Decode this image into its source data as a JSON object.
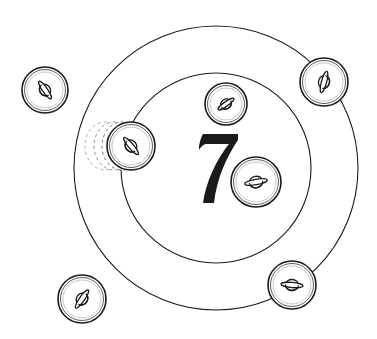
{
  "scene": {
    "title": "Coin toss ring game",
    "number": "7",
    "background": "#ffffff",
    "ink": "#1a1a1a",
    "outer_ring": {
      "cx": 216,
      "cy": 168,
      "r": 142
    },
    "inner_ring": {
      "cx": 216,
      "cy": 168,
      "r": 95
    }
  },
  "coins": [
    {
      "id": "coin-top-left-outside",
      "cx": 45,
      "cy": 90,
      "r": 23,
      "glyph_angle": 55,
      "position": "outside rings, top-left"
    },
    {
      "id": "coin-left-moving",
      "cx": 131,
      "cy": 146,
      "r": 24,
      "glyph_angle": 50,
      "position": "on inner ring, left (moving, motion trail)"
    },
    {
      "id": "coin-top-inner",
      "cx": 226,
      "cy": 104,
      "r": 21,
      "glyph_angle": -35,
      "position": "inside inner ring, top"
    },
    {
      "id": "coin-top-right-ring",
      "cx": 324,
      "cy": 82,
      "r": 24,
      "glyph_angle": -75,
      "position": "on outer ring, top-right"
    },
    {
      "id": "coin-center-right",
      "cx": 256,
      "cy": 182,
      "r": 25,
      "glyph_angle": -10,
      "position": "inside inner ring, next to 7"
    },
    {
      "id": "coin-bottom-right-ring",
      "cx": 292,
      "cy": 285,
      "r": 24,
      "glyph_angle": 5,
      "position": "on outer ring, bottom-right"
    },
    {
      "id": "coin-bottom-left-outside",
      "cx": 82,
      "cy": 299,
      "r": 24,
      "glyph_angle": -55,
      "position": "outside rings, bottom-left"
    }
  ]
}
